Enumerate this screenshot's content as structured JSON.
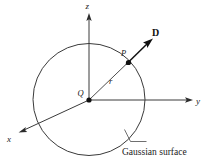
{
  "figure": {
    "caption": "Gaussian surface",
    "background_color": "#ffffff",
    "line_color": "#3a3a3a",
    "vector_color": "#111111",
    "axes": {
      "z_label": "z",
      "y_label": "y",
      "x_label": "x"
    },
    "labels": {
      "charge": "Q",
      "point": "P",
      "radius": "r",
      "flux_density": "D"
    },
    "geometry": {
      "origin_x": 89,
      "origin_y": 100,
      "circle_radius": 56,
      "z_tip_x": 89,
      "z_tip_y": 14,
      "y_tip_x": 193,
      "y_tip_y": 100,
      "x_tip_x": 19,
      "x_tip_y": 133,
      "point_p_x": 128,
      "point_p_y": 62,
      "vector_tip_x": 153,
      "vector_tip_y": 39
    }
  }
}
